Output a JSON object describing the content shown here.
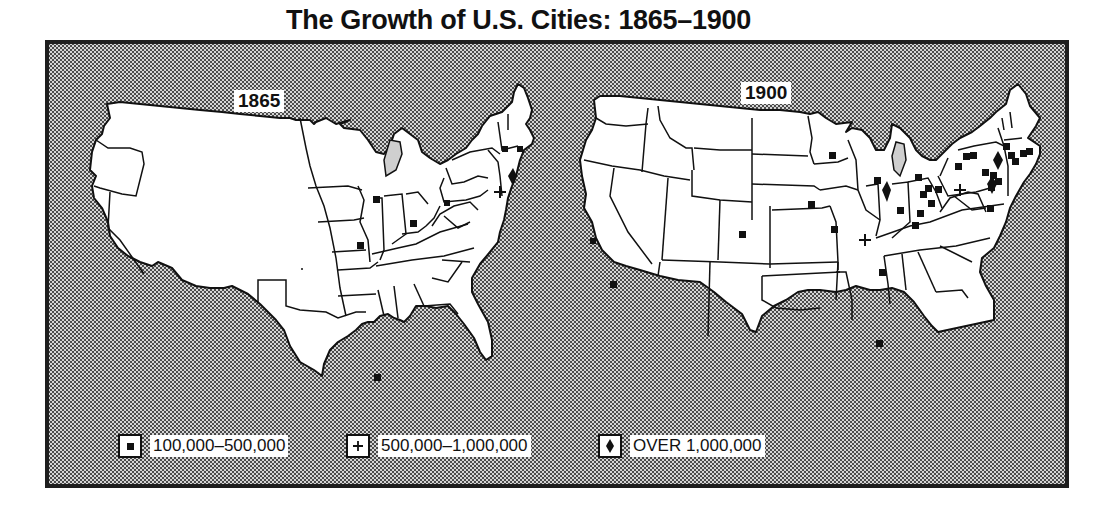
{
  "title": "The Growth of U.S. Cities: 1865–1900",
  "maps": [
    {
      "year_label": "1865",
      "cities": {
        "100k_500k": 9,
        "500k_1m": 1,
        "over_1m": 1
      }
    },
    {
      "year_label": "1900",
      "cities": {
        "100k_500k": 30,
        "500k_1m": 2,
        "over_1m": 3
      }
    }
  ],
  "legend": [
    {
      "symbol": "square-icon",
      "label": "100,000–500,000"
    },
    {
      "symbol": "plus-icon",
      "label": "500,000–1,000,000"
    },
    {
      "symbol": "diamond-icon",
      "label": "OVER 1,000,000"
    }
  ],
  "colors": {
    "frame": "#1e1e1e",
    "land": "#ffffff",
    "halftone_dot": "#4a4a4a",
    "marker": "#111111"
  }
}
